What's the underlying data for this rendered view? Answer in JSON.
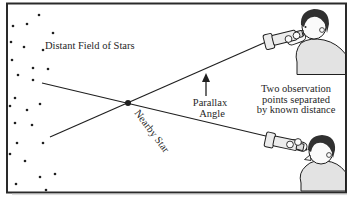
{
  "diagram": {
    "labels": {
      "distant_field": "Distant Field of Stars",
      "nearby_star": "Nearby Star",
      "parallax_line1": "Parallax",
      "parallax_line2": "Angle",
      "observation_line1": "Two observation",
      "observation_line2": "points separated",
      "observation_line3": "by known distance"
    },
    "stars": [
      [
        39,
        15
      ],
      [
        13,
        26
      ],
      [
        27,
        24
      ],
      [
        53,
        33
      ],
      [
        11,
        42
      ],
      [
        24,
        47
      ],
      [
        43,
        50
      ],
      [
        12,
        60
      ],
      [
        33,
        68
      ],
      [
        48,
        69
      ],
      [
        18,
        75
      ],
      [
        33,
        80
      ],
      [
        15,
        98
      ],
      [
        10,
        106
      ],
      [
        27,
        110
      ],
      [
        40,
        104
      ],
      [
        15,
        123
      ],
      [
        32,
        125
      ],
      [
        17,
        143
      ],
      [
        43,
        143
      ],
      [
        10,
        154
      ],
      [
        25,
        161
      ],
      [
        55,
        174
      ],
      [
        40,
        177
      ],
      [
        16,
        184
      ],
      [
        46,
        190
      ]
    ],
    "sight_lines": [
      {
        "x1": 266,
        "y1": 42,
        "x2": 50,
        "y2": 137
      },
      {
        "x1": 270,
        "y1": 137,
        "x2": 42,
        "y2": 83
      }
    ],
    "nearby_star_dot": {
      "x": 128,
      "y": 103,
      "r": 3
    },
    "arrow": {
      "x": 206,
      "y_tail": 96,
      "y_tip": 73
    }
  },
  "colors": {
    "ink": "#1f1f1f",
    "frame": "#2a2a2a",
    "shirt": "#e3e3e3",
    "hair": "#303030",
    "skin": "#fafafa",
    "scope": "#ececec",
    "shadow": "#cfcfcf"
  }
}
